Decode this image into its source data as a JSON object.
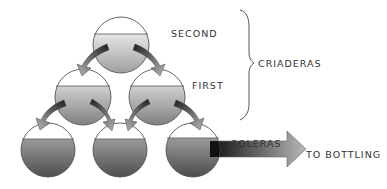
{
  "diagram": {
    "type": "solera-system",
    "tiers": [
      {
        "name": "second",
        "label": "SECOND",
        "group": "criaderas"
      },
      {
        "name": "first",
        "label": "FIRST",
        "group": "criaderas"
      },
      {
        "name": "soleras",
        "label": "SOLERAS",
        "group": "soleras"
      }
    ],
    "labels": {
      "second": "SECOND",
      "first": "FIRST",
      "criaderas": "CRIADERAS",
      "soleras": "SOLERAS",
      "bottling": "TO BOTTLING"
    },
    "barrels": [
      {
        "tier": "second",
        "cx": 121,
        "cy": 45,
        "r": 28
      },
      {
        "tier": "first",
        "cx": 83,
        "cy": 97,
        "r": 28
      },
      {
        "tier": "first",
        "cx": 157,
        "cy": 97,
        "r": 28
      },
      {
        "tier": "soleras",
        "cx": 48,
        "cy": 150,
        "r": 27
      },
      {
        "tier": "soleras",
        "cx": 120,
        "cy": 150,
        "r": 27
      },
      {
        "tier": "soleras",
        "cx": 193,
        "cy": 150,
        "r": 27
      }
    ],
    "colors": {
      "outline": "#555555",
      "liquid_dark": "#5a5a5a",
      "liquid_light": "#d8d8d8",
      "arrow_dark": "#2a2a2a",
      "arrow_light": "#b0b0b0",
      "text": "#333333"
    }
  }
}
